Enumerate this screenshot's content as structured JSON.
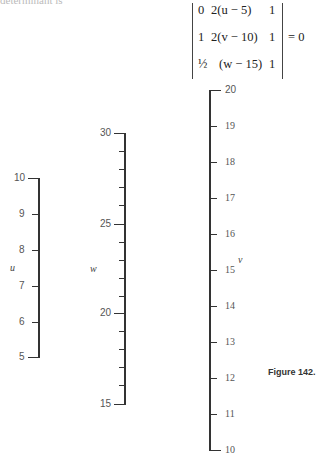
{
  "header": {
    "cut_text": "determinant is"
  },
  "equation": {
    "rows": [
      [
        "0",
        "2(u − 5)",
        "1"
      ],
      [
        "1",
        "2(v − 10)",
        "1"
      ],
      [
        "½",
        "(w − 15)",
        "1"
      ]
    ],
    "equals": "= 0"
  },
  "scales": {
    "u": {
      "name": "u",
      "min": 5,
      "max": 10,
      "major_labels": [
        "10",
        "9",
        "8",
        "7",
        "6",
        "5"
      ]
    },
    "w": {
      "name": "w",
      "min": 15,
      "max": 30,
      "major_labels": [
        "30",
        "25",
        "20",
        "15"
      ],
      "minor_step": 1
    },
    "v": {
      "name": "v",
      "min": 10,
      "max": 20,
      "major_labels": [
        "20",
        "19",
        "18",
        "17",
        "16",
        "15",
        "14",
        "13",
        "12",
        "11",
        "10"
      ]
    }
  },
  "caption": "Figure 142."
}
